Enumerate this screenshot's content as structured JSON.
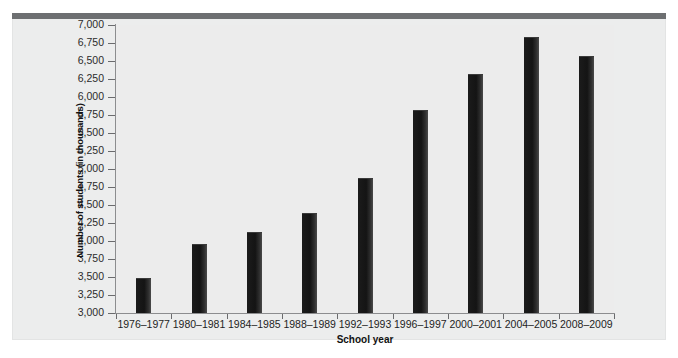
{
  "figure": {
    "background_color": "#ffffff",
    "panel_color": "#eceded",
    "top_rule_color": "#6d6f71",
    "bar_color": "#1a1a1a",
    "axis_color": "#8c8d8f"
  },
  "chart_data": {
    "type": "bar",
    "title": "",
    "xlabel": "School year",
    "ylabel": "Number of students (in thousands)",
    "categories": [
      "1976–1977",
      "1980–1981",
      "1984–1985",
      "1988–1989",
      "1992–1993",
      "1996–1997",
      "2000–2001",
      "2004–2005",
      "2008–2009"
    ],
    "values": [
      3490,
      3960,
      4125,
      4390,
      4875,
      5820,
      6320,
      6830,
      6570
    ],
    "ylim": [
      3000,
      7000
    ],
    "ytick_labels": [
      "7,000",
      "6,750",
      "6,500",
      "6,250",
      "6,000",
      "5,750",
      "5,500",
      "5,250",
      "5,000",
      "4,750",
      "4,500",
      "4,250",
      "4,000",
      "3,750",
      "3,500",
      "3,250",
      "3,000"
    ],
    "ytick_values": [
      7000,
      6750,
      6500,
      6250,
      6000,
      5750,
      5500,
      5250,
      5000,
      4750,
      4500,
      4250,
      4000,
      3750,
      3500,
      3250,
      3000
    ],
    "grid": false,
    "legend": null,
    "legend_position": "none"
  }
}
